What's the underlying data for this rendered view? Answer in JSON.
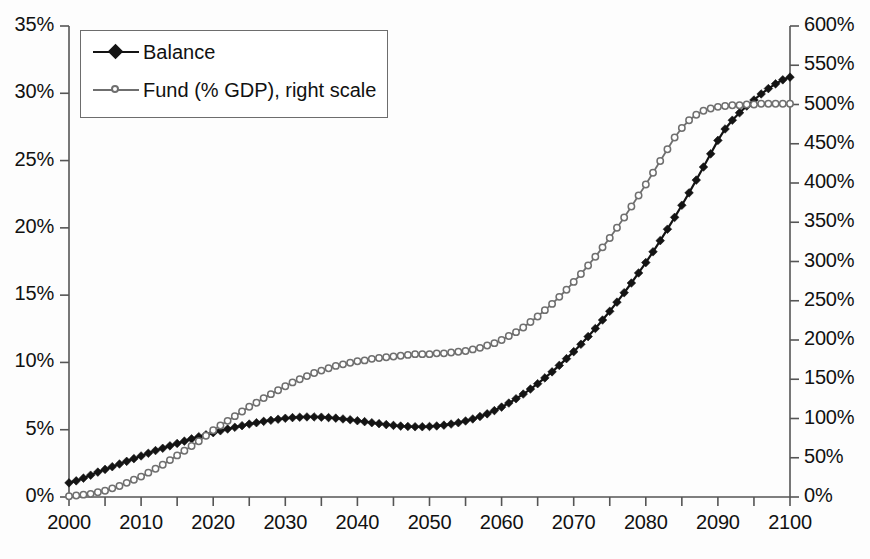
{
  "chart_data": {
    "type": "line",
    "title": "",
    "subtitle": "",
    "xlabel": "",
    "ylabel": "",
    "grid": false,
    "legend_position": "top-left",
    "x": [
      2000,
      2001,
      2002,
      2003,
      2004,
      2005,
      2006,
      2007,
      2008,
      2009,
      2010,
      2011,
      2012,
      2013,
      2014,
      2015,
      2016,
      2017,
      2018,
      2019,
      2020,
      2021,
      2022,
      2023,
      2024,
      2025,
      2026,
      2027,
      2028,
      2029,
      2030,
      2031,
      2032,
      2033,
      2034,
      2035,
      2036,
      2037,
      2038,
      2039,
      2040,
      2041,
      2042,
      2043,
      2044,
      2045,
      2046,
      2047,
      2048,
      2049,
      2050,
      2051,
      2052,
      2053,
      2054,
      2055,
      2056,
      2057,
      2058,
      2059,
      2060,
      2061,
      2062,
      2063,
      2064,
      2065,
      2066,
      2067,
      2068,
      2069,
      2070,
      2071,
      2072,
      2073,
      2074,
      2075,
      2076,
      2077,
      2078,
      2079,
      2080,
      2081,
      2082,
      2083,
      2084,
      2085,
      2086,
      2087,
      2088,
      2089,
      2090,
      2091,
      2092,
      2093,
      2094,
      2095,
      2096,
      2097,
      2098,
      2099,
      2100
    ],
    "x_axis": {
      "min": 2000,
      "max": 2100,
      "tick_interval": 5,
      "label_interval": 10,
      "tick_labels": [
        "2000",
        "2010",
        "2020",
        "2030",
        "2040",
        "2050",
        "2060",
        "2070",
        "2080",
        "2090",
        "2100"
      ]
    },
    "y_axis_left": {
      "min": 0,
      "max": 35,
      "unit": "%",
      "tick_interval": 5,
      "tick_labels": [
        "0%",
        "5%",
        "10%",
        "15%",
        "20%",
        "25%",
        "30%",
        "35%"
      ]
    },
    "y_axis_right": {
      "min": 0,
      "max": 600,
      "unit": "%",
      "tick_interval": 50,
      "tick_labels": [
        "0%",
        "50%",
        "100%",
        "150%",
        "200%",
        "250%",
        "300%",
        "350%",
        "400%",
        "450%",
        "500%",
        "550%",
        "600%"
      ]
    },
    "series": [
      {
        "name": "Balance",
        "label": "Balance",
        "axis": "left",
        "color": "#141414",
        "marker": "filled-diamond",
        "values": [
          1.05,
          1.2,
          1.4,
          1.62,
          1.85,
          2.05,
          2.25,
          2.45,
          2.65,
          2.85,
          3.05,
          3.25,
          3.45,
          3.62,
          3.8,
          3.98,
          4.15,
          4.32,
          4.48,
          4.62,
          4.78,
          4.92,
          5.05,
          5.18,
          5.3,
          5.42,
          5.52,
          5.62,
          5.7,
          5.78,
          5.85,
          5.9,
          5.93,
          5.95,
          5.95,
          5.93,
          5.9,
          5.86,
          5.8,
          5.74,
          5.67,
          5.6,
          5.52,
          5.45,
          5.38,
          5.32,
          5.27,
          5.24,
          5.22,
          5.22,
          5.24,
          5.28,
          5.34,
          5.42,
          5.52,
          5.65,
          5.8,
          5.98,
          6.18,
          6.42,
          6.68,
          6.98,
          7.3,
          7.65,
          8.02,
          8.42,
          8.85,
          9.3,
          9.78,
          10.28,
          10.8,
          11.35,
          11.92,
          12.52,
          13.15,
          13.8,
          14.48,
          15.18,
          15.9,
          16.65,
          17.42,
          18.22,
          19.05,
          19.9,
          20.78,
          21.68,
          22.6,
          23.55,
          24.52,
          25.5,
          26.5,
          27.35,
          28.0,
          28.55,
          29.05,
          29.5,
          29.95,
          30.35,
          30.7,
          31.0,
          31.2
        ]
      },
      {
        "name": "Fund (% GDP), right scale",
        "label": "Fund (% GDP), right scale",
        "axis": "right",
        "color": "#6f6f6f",
        "marker": "open-circle",
        "values": [
          1,
          2,
          3,
          4,
          6,
          8,
          11,
          14,
          18,
          22,
          26,
          31,
          36,
          41,
          47,
          53,
          59,
          65,
          71,
          78,
          85,
          91,
          97,
          103,
          109,
          115,
          120,
          126,
          131,
          136,
          141,
          146,
          150,
          154,
          158,
          161,
          164,
          167,
          169,
          171,
          173,
          174,
          176,
          177,
          178,
          179,
          180,
          181,
          182,
          182,
          182,
          183,
          183,
          184,
          185,
          186,
          188,
          190,
          193,
          196,
          200,
          205,
          210,
          216,
          223,
          230,
          238,
          246,
          255,
          264,
          274,
          284,
          295,
          306,
          318,
          330,
          343,
          356,
          370,
          384,
          398,
          413,
          428,
          443,
          458,
          470,
          480,
          487,
          492,
          495,
          497,
          498,
          499,
          499,
          500,
          500,
          501,
          501,
          501,
          501,
          501
        ]
      }
    ],
    "annotations": []
  },
  "legend": {
    "items": [
      {
        "label": "Balance",
        "marker": "filled-diamond",
        "color": "#141414"
      },
      {
        "label": "Fund (% GDP), right scale",
        "marker": "open-circle",
        "color": "#6f6f6f"
      }
    ]
  },
  "colors": {
    "balance": "#141414",
    "fund": "#6f6f6f",
    "axis": "#555555",
    "background": "#fdfdfd",
    "text": "#111111"
  }
}
